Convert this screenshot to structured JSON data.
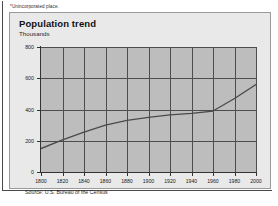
{
  "footnote": "*Unincorporated place.",
  "card": {
    "title": "Population trend",
    "subtitle": "Thousands",
    "source": "Source: U.S. Bureau of the Census"
  },
  "colors": {
    "plot_background": "#bdbdbd",
    "card_background": "#e9e9e9",
    "grid": "#4d4d4d",
    "axis": "#333333",
    "series": "#4a4a4a"
  },
  "chart_data": {
    "type": "line",
    "title": "Population trend",
    "xlabel": "",
    "ylabel": "Thousands",
    "xlim": [
      1800,
      2000
    ],
    "ylim": [
      0,
      800
    ],
    "grid": true,
    "legend": null,
    "ytick_labels": [
      "0",
      "200",
      "400",
      "600",
      "800"
    ],
    "ytick_values": [
      0,
      200,
      400,
      600,
      800
    ],
    "xtick_labels": [
      "1800",
      "1820",
      "1840",
      "1860",
      "1880",
      "1900",
      "1920",
      "1940",
      "1960",
      "1980",
      "2000"
    ],
    "xtick_values": [
      1800,
      1820,
      1840,
      1860,
      1880,
      1900,
      1920,
      1940,
      1960,
      1980,
      2000
    ],
    "x": [
      1800,
      1820,
      1840,
      1860,
      1880,
      1900,
      1920,
      1940,
      1960,
      1980,
      2000
    ],
    "values": [
      150,
      205,
      255,
      300,
      330,
      350,
      365,
      375,
      390,
      470,
      560
    ],
    "series": [
      {
        "name": "Population",
        "values": [
          150,
          205,
          255,
          300,
          330,
          350,
          365,
          375,
          390,
          470,
          560
        ]
      }
    ]
  }
}
